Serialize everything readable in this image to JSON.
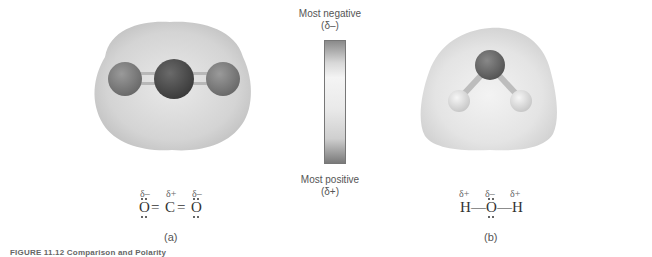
{
  "scale": {
    "top_label": "Most negative",
    "top_sub": "(δ–)",
    "bottom_label": "Most positive",
    "bottom_sub": "(δ+)",
    "gradient_colors": [
      "#7a7a7a",
      "#f2f2f2",
      "#d8d8d8",
      "#6e6e6e"
    ]
  },
  "panel_a": {
    "molecule": "CO2",
    "deltas": [
      "δ–",
      "δ+",
      "δ–"
    ],
    "atoms": [
      "O",
      "C",
      "O"
    ],
    "bond": "=",
    "label": "(a)",
    "colors": {
      "cloud": "#d9d9d9",
      "oxygen": "#7d7d7d",
      "carbon": "#4e4e4e"
    }
  },
  "panel_b": {
    "molecule": "H2O",
    "deltas": [
      "δ+",
      "δ–",
      "δ+"
    ],
    "atoms": [
      "H",
      "O",
      "H"
    ],
    "bond": "—",
    "label": "(b)",
    "colors": {
      "cloud": "#e6e6e6",
      "oxygen": "#6a6a6a",
      "hydrogen": "#e0e0e0"
    }
  },
  "caption": "FIGURE 11.12  Comparison and Polarity"
}
